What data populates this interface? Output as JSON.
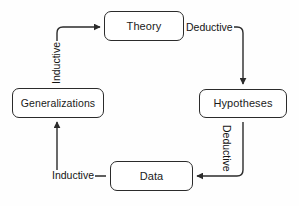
{
  "diagram": {
    "style": {
      "background": "#fefefe",
      "line_color": "#2b2b2b",
      "text_color": "#1a1a1a",
      "box_fill": "#ffffff"
    },
    "nodes": [
      {
        "id": "theory",
        "label": "Theory"
      },
      {
        "id": "hypotheses",
        "label": "Hypotheses"
      },
      {
        "id": "data",
        "label": "Data"
      },
      {
        "id": "generalizations",
        "label": "Generalizations"
      }
    ],
    "edges": [
      {
        "id": "theory-to-hypotheses",
        "label": "Deductive",
        "from": "theory",
        "to": "hypotheses",
        "orientation": "horizontal"
      },
      {
        "id": "hypotheses-to-data",
        "label": "Deductive",
        "from": "hypotheses",
        "to": "data",
        "orientation": "vertical-down"
      },
      {
        "id": "data-to-generalizations",
        "label": "Inductive",
        "from": "data",
        "to": "generalizations",
        "orientation": "horizontal"
      },
      {
        "id": "generalizations-to-theory",
        "label": "Inductive",
        "from": "generalizations",
        "to": "theory",
        "orientation": "vertical-up"
      }
    ]
  }
}
